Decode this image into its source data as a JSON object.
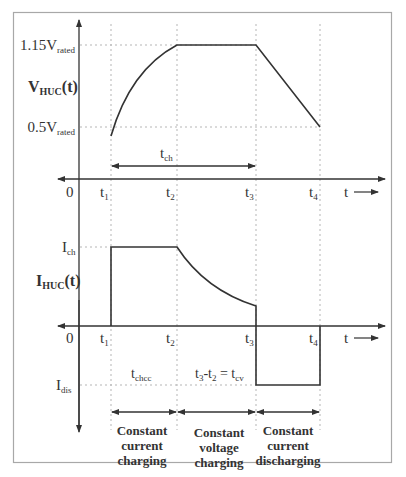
{
  "diagram": {
    "voltage_plot": {
      "y_label_main": "V",
      "y_label_sub": "HUC",
      "y_label_suffix": "(t)",
      "levels": [
        {
          "main": "1.15V",
          "sub": "rated"
        },
        {
          "main": "0.5V",
          "sub": "rated"
        }
      ],
      "interval_label_main": "t",
      "interval_label_sub": "ch",
      "origin": "0",
      "time_label": "t"
    },
    "current_plot": {
      "y_label_main": "I",
      "y_label_sub": "HUC",
      "y_label_suffix": "(t)",
      "level_ch_main": "I",
      "level_ch_sub": "ch",
      "level_dis_main": "I",
      "level_dis_sub": "dis",
      "origin": "0",
      "time_label": "t",
      "interval_cc_main": "t",
      "interval_cc_sub": "chcc",
      "interval_cv": {
        "a_main": "t",
        "a_sub": "3",
        "dash": "-",
        "b_main": "t",
        "b_sub": "2",
        "eq": " = ",
        "c_main": "t",
        "c_sub": "cv"
      }
    },
    "time_ticks": [
      {
        "main": "t",
        "sub": "1"
      },
      {
        "main": "t",
        "sub": "2"
      },
      {
        "main": "t",
        "sub": "3"
      },
      {
        "main": "t",
        "sub": "4"
      }
    ],
    "phases": [
      {
        "lines": [
          "Constant",
          "current",
          "charging"
        ]
      },
      {
        "lines": [
          "Constant",
          "voltage",
          "charging"
        ]
      },
      {
        "lines": [
          "Constant",
          "current",
          "discharging"
        ]
      }
    ],
    "colors": {
      "line": "#333333",
      "guide": "#b5b5b5",
      "frame": "#a8a8a8"
    }
  }
}
